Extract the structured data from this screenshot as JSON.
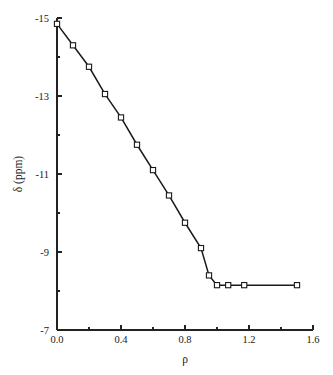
{
  "chart_data": {
    "type": "line",
    "title": "",
    "subtitle": "",
    "xlabel": "ρ",
    "ylabel": "δ (ppm)",
    "xlim": [
      0.0,
      1.6
    ],
    "ylim": [
      -15,
      -7
    ],
    "y_axis_inverted": true,
    "grid": false,
    "legend": null,
    "x_ticks": [
      "0.0",
      "0.4",
      "0.8",
      "1.2",
      "1.6"
    ],
    "x_tick_values": [
      0.0,
      0.4,
      0.8,
      1.2,
      1.6
    ],
    "x_minor_tick_values": [
      0.2,
      0.6,
      1.0,
      1.4
    ],
    "y_ticks": [
      "-15",
      "-13",
      "-11",
      "-9",
      "-7"
    ],
    "y_tick_values": [
      -15,
      -13,
      -11,
      -9,
      -7
    ],
    "y_minor_tick_values": [
      -14,
      -12,
      -10,
      -8
    ],
    "marker": "open-square",
    "series": [
      {
        "name": "delta vs rho",
        "x": [
          0.0,
          0.1,
          0.2,
          0.3,
          0.4,
          0.5,
          0.6,
          0.7,
          0.8,
          0.9,
          0.95,
          1.0,
          1.07,
          1.17,
          1.5
        ],
        "y": [
          -14.85,
          -14.3,
          -13.75,
          -13.05,
          -12.45,
          -11.75,
          -11.1,
          -10.45,
          -9.75,
          -9.1,
          -8.4,
          -8.15,
          -8.15,
          -8.15,
          -8.15
        ]
      }
    ]
  },
  "figure": {
    "background_color": "#ffffff",
    "line_color": "#1a1a1a",
    "marker_fill": "#ffffff",
    "axis_color": "#222222"
  }
}
